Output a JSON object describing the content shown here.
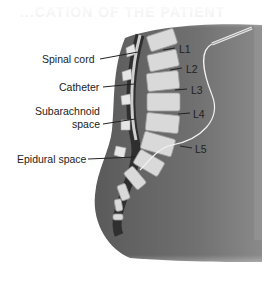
{
  "figure": {
    "faded_heading": "...CATION OF THE PATIENT",
    "labels": {
      "spinal_cord": "Spinal cord",
      "catheter": "Catheter",
      "subarachnoid_line1": "Subarachnoid",
      "subarachnoid_line2": "space",
      "epidural_space": "Epidural space",
      "l1": "L1",
      "l2": "L2",
      "l3": "L3",
      "l4": "L4",
      "l5": "L5"
    },
    "colors": {
      "body": "#6f6f6f",
      "body_dark": "#4a4a4a",
      "vertebra": "#d9d9d9",
      "canal": "#3a3a3a",
      "catheter": "#f2f2f2"
    }
  }
}
